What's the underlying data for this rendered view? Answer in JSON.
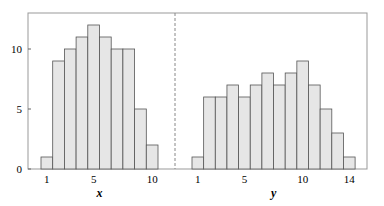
{
  "chart_data": [
    {
      "type": "bar",
      "title": "",
      "xlabel": "x",
      "ylabel": "",
      "categories": [
        1,
        2,
        3,
        4,
        5,
        6,
        7,
        8,
        9,
        10
      ],
      "values": [
        1,
        9,
        10,
        11,
        12,
        11,
        10,
        10,
        5,
        2
      ],
      "xticks": [
        1,
        5,
        10
      ],
      "yticks": [
        0,
        5,
        10
      ],
      "ylim": [
        0,
        13
      ]
    },
    {
      "type": "bar",
      "title": "",
      "xlabel": "y",
      "ylabel": "",
      "categories": [
        1,
        2,
        3,
        4,
        5,
        6,
        7,
        8,
        9,
        10,
        11,
        12,
        13,
        14
      ],
      "values": [
        1,
        6,
        6,
        7,
        6,
        7,
        8,
        7,
        8,
        9,
        7,
        5,
        3,
        1
      ],
      "xticks": [
        1,
        5,
        10,
        14
      ],
      "yticks": [
        0,
        5,
        10
      ],
      "ylim": [
        0,
        13
      ]
    }
  ],
  "colors": {
    "bar_fill": "#e6e6e6",
    "bar_edge": "#555555",
    "frame": "#999999"
  }
}
